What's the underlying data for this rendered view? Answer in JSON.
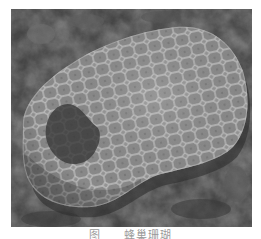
{
  "image": {
    "subject": "honeycomb coral fossil",
    "description": "Grayscale photograph of a rounded fossil coral colony with polygonal honeycomb corallite pattern resting on dark rocky ground",
    "colors": {
      "background_rock": "#3a3a3a",
      "fossil_surface": "#9c9c9c",
      "cell_walls": "#d2d2d2",
      "shadow": "#2a2a2a"
    }
  },
  "caption": {
    "figure_label": "图",
    "title": "蜂巢珊瑚",
    "truncated": true
  }
}
